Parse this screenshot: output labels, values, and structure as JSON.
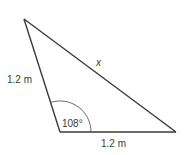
{
  "figure": {
    "type": "triangle",
    "vertices": {
      "top": [
        24,
        19
      ],
      "bottom_left": [
        60,
        132
      ],
      "bottom_right": [
        176,
        132
      ]
    },
    "stroke_color": "#3a3a3a",
    "labels": {
      "left_side": "1.2 m",
      "hypotenuse": "x",
      "angle": "108°",
      "bottom_side": "1.2 m"
    },
    "angle_arc": {
      "at_vertex": "bottom_left",
      "radius": 31,
      "degrees": 108
    }
  }
}
